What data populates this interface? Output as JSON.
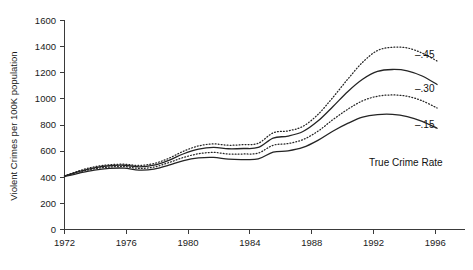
{
  "chart_data": {
    "type": "line",
    "title": "",
    "xlabel": "",
    "ylabel": "Violent Crimes per 100K population",
    "xlim": [
      1972,
      1998
    ],
    "ylim": [
      0,
      1600
    ],
    "yticks": [
      0,
      200,
      400,
      600,
      800,
      1000,
      1200,
      1400,
      1600
    ],
    "xticks": [
      1972,
      1976,
      1980,
      1984,
      1988,
      1992,
      1996
    ],
    "grid": false,
    "legend_position": "right-inline",
    "x": [
      1972,
      1973,
      1974,
      1975,
      1976,
      1977,
      1978,
      1979,
      1980,
      1981,
      1982,
      1983,
      1984,
      1985,
      1986,
      1987,
      1988,
      1989,
      1990,
      1991,
      1992,
      1993,
      1994,
      1995,
      1996,
      1997
    ],
    "series": [
      {
        "name": "-.45",
        "label": "–.45",
        "style": "dotted",
        "values": [
          410,
          450,
          480,
          495,
          500,
          490,
          505,
          545,
          600,
          640,
          655,
          645,
          650,
          660,
          740,
          755,
          790,
          880,
          1010,
          1150,
          1280,
          1370,
          1395,
          1390,
          1350,
          1290
        ]
      },
      {
        "name": "-.30",
        "label": "–.30",
        "style": "solid",
        "values": [
          410,
          445,
          472,
          488,
          492,
          480,
          492,
          530,
          580,
          615,
          628,
          618,
          620,
          628,
          700,
          715,
          750,
          830,
          940,
          1055,
          1150,
          1210,
          1225,
          1215,
          1175,
          1110
        ]
      },
      {
        "name": "-.15",
        "label": "–.15",
        "style": "dotted",
        "values": [
          408,
          440,
          465,
          478,
          482,
          468,
          478,
          512,
          552,
          580,
          590,
          578,
          578,
          585,
          645,
          658,
          688,
          752,
          840,
          920,
          985,
          1020,
          1030,
          1020,
          985,
          930
        ]
      },
      {
        "name": "True Crime Rate",
        "label": "True Crime Rate",
        "style": "solid",
        "values": [
          405,
          432,
          455,
          468,
          470,
          455,
          462,
          492,
          528,
          548,
          552,
          538,
          535,
          540,
          592,
          602,
          628,
          682,
          752,
          812,
          860,
          880,
          882,
          865,
          828,
          775
        ]
      }
    ]
  },
  "axis": {
    "y_title": "Violent Crimes per 100K population",
    "y_tick_labels": [
      "1600",
      "1400",
      "1200",
      "1000",
      "800",
      "600",
      "400",
      "200",
      "0"
    ],
    "x_tick_labels": [
      "1972",
      "1976",
      "1980",
      "1984",
      "1988",
      "1992",
      "1996"
    ]
  },
  "series_labels": {
    "s45": "–.45",
    "s30": "–.30",
    "s15": "–.15",
    "true_rate": "True Crime Rate"
  },
  "caption": {
    "partial_text": ""
  }
}
